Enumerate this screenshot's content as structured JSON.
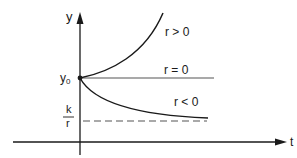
{
  "diagram": {
    "type": "exponential-growth-curves",
    "axes": {
      "x_label": "t",
      "y_label": "y"
    },
    "initial_value_label": {
      "base": "y",
      "subscript": "0"
    },
    "asymptote_label": {
      "numerator": "k",
      "denominator": "r"
    },
    "curves": [
      {
        "name": "growth",
        "label": "r > 0",
        "behavior": "increasing"
      },
      {
        "name": "constant",
        "label": "r = 0",
        "behavior": "flat"
      },
      {
        "name": "decay",
        "label": "r < 0",
        "behavior": "decreasing-to-asymptote"
      }
    ],
    "colors": {
      "ink": "#1a1a1a",
      "line": "#555555"
    }
  }
}
